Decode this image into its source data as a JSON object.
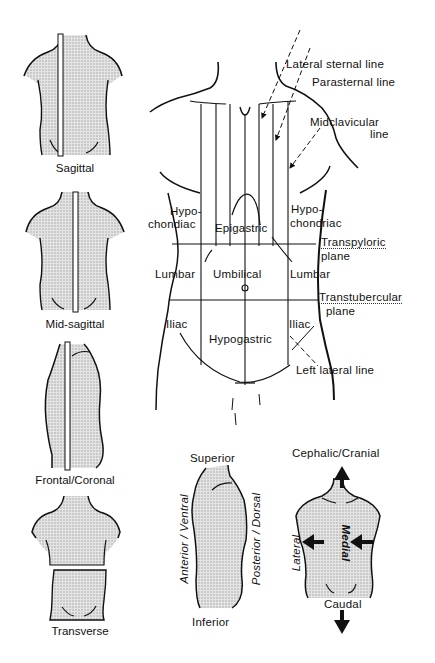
{
  "figure": {
    "shade_color": "#d6d6d6",
    "line_color": "#111111"
  },
  "planes": [
    {
      "id": "sagittal",
      "label": "Sagittal"
    },
    {
      "id": "mid-sagittal",
      "label": "Mid-sagittal"
    },
    {
      "id": "frontal",
      "label": "Frontal/Coronal"
    },
    {
      "id": "transverse",
      "label": "Transverse"
    }
  ],
  "lines": {
    "lateral_sternal": "Lateral sternal line",
    "parasternal": "Parasternal line",
    "midclavicular_1": "Midclavicular",
    "midclavicular_2": "line",
    "left_lateral": "Left lateral line"
  },
  "regions": {
    "hypo_left_1": "Hypo-",
    "hypo_left_2": "chondiac",
    "epigastric": "Epigastric",
    "hypo_right_1": "Hypo-",
    "hypo_right_2": "chondriac",
    "lumbar_left": "Lumbar",
    "umbilical": "Umbilical",
    "lumbar_right": "Lumbar",
    "iliac_left": "Iliac",
    "hypogastric": "Hypogastric",
    "iliac_right": "Iliac"
  },
  "horizontal_planes": {
    "transpyloric_1": "Transpyloric",
    "transpyloric_2": "plane",
    "transtubercular_1": "Transtubercular",
    "transtubercular_2": "plane"
  },
  "directions_side": {
    "superior": "Superior",
    "inferior": "Inferior",
    "anterior": "Anterior / Ventral",
    "posterior": "Posterior / Dorsal"
  },
  "directions_front": {
    "cephalic": "Cephalic/Cranial",
    "caudal": "Caudal",
    "lateral": "Lateral",
    "medial": "Medial"
  }
}
